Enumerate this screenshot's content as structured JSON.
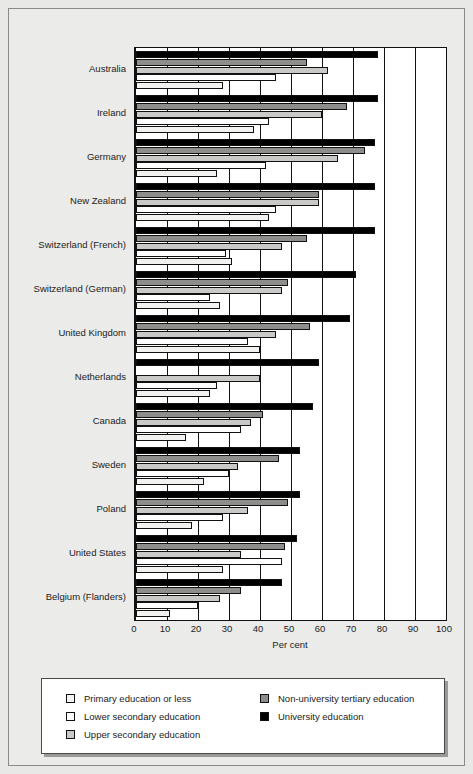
{
  "chart_data": {
    "type": "bar",
    "orientation": "horizontal",
    "title": "",
    "xlabel": "Per cent",
    "ylabel": "",
    "xlim": [
      0,
      100
    ],
    "xticks": [
      0,
      10,
      20,
      30,
      40,
      50,
      60,
      70,
      80,
      90,
      100
    ],
    "grid": true,
    "legend_position": "bottom",
    "categories": [
      "Australia",
      "Ireland",
      "Germany",
      "New Zealand",
      "Switzerland (French)",
      "Switzerland (German)",
      "United Kingdom",
      "Netherlands",
      "Canada",
      "Sweden",
      "Poland",
      "United States",
      "Belgium (Flanders)"
    ],
    "series": [
      {
        "name": "University education",
        "key": "uni",
        "color": "#000000",
        "values": [
          78,
          78,
          77,
          77,
          77,
          71,
          69,
          59,
          57,
          53,
          53,
          52,
          47
        ]
      },
      {
        "name": "Non-university tertiary education",
        "key": "nonuni",
        "color": "#8d8d8b",
        "values": [
          55,
          68,
          74,
          59,
          55,
          49,
          56,
          0,
          41,
          46,
          49,
          48,
          34
        ]
      },
      {
        "name": "Upper secondary education",
        "key": "uppsec",
        "color": "#c9c9c7",
        "values": [
          62,
          60,
          65,
          59,
          47,
          47,
          45,
          40,
          37,
          33,
          36,
          34,
          27
        ]
      },
      {
        "name": "Lower secondary education",
        "key": "lowsec",
        "color": "#ffffff",
        "values": [
          45,
          43,
          42,
          45,
          29,
          24,
          36,
          26,
          34,
          30,
          28,
          47,
          20
        ]
      },
      {
        "name": "Primary education or less",
        "key": "primary",
        "color": "#f2f2f0",
        "values": [
          28,
          38,
          26,
          43,
          31,
          27,
          40,
          24,
          16,
          22,
          18,
          28,
          11
        ]
      }
    ]
  },
  "legend": {
    "left": [
      {
        "label": "Primary education or less",
        "swatch": "#f2f2f0"
      },
      {
        "label": "Lower secondary education",
        "swatch": "#ffffff"
      },
      {
        "label": "Upper secondary education",
        "swatch": "#c9c9c7"
      }
    ],
    "right": [
      {
        "label": "Non-university tertiary education",
        "swatch": "#8d8d8b"
      },
      {
        "label": "University education",
        "swatch": "#000000"
      }
    ]
  }
}
